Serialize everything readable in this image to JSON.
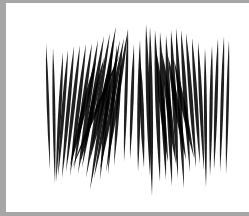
{
  "artwork": {
    "description": "abstract black needle strokes on white canvas",
    "colors": {
      "stroke": "#000000",
      "canvas": "#ffffff",
      "border": "#a6a6a6"
    },
    "strokes": [
      {
        "x1": 46,
        "y1": 43,
        "x2": 50,
        "y2": 170,
        "w": 2.6
      },
      {
        "x1": 53,
        "y1": 48,
        "x2": 55,
        "y2": 184,
        "w": 2.8
      },
      {
        "x1": 63,
        "y1": 52,
        "x2": 56,
        "y2": 182,
        "w": 3.2
      },
      {
        "x1": 68,
        "y1": 50,
        "x2": 58,
        "y2": 176,
        "w": 3.4
      },
      {
        "x1": 74,
        "y1": 46,
        "x2": 62,
        "y2": 178,
        "w": 3.6
      },
      {
        "x1": 80,
        "y1": 45,
        "x2": 66,
        "y2": 172,
        "w": 3.6
      },
      {
        "x1": 86,
        "y1": 44,
        "x2": 70,
        "y2": 176,
        "w": 3.8
      },
      {
        "x1": 92,
        "y1": 43,
        "x2": 74,
        "y2": 170,
        "w": 3.8
      },
      {
        "x1": 98,
        "y1": 40,
        "x2": 78,
        "y2": 174,
        "w": 4.0
      },
      {
        "x1": 104,
        "y1": 36,
        "x2": 82,
        "y2": 168,
        "w": 4.0
      },
      {
        "x1": 110,
        "y1": 33,
        "x2": 86,
        "y2": 178,
        "w": 4.0
      },
      {
        "x1": 116,
        "y1": 26,
        "x2": 90,
        "y2": 190,
        "w": 4.2
      },
      {
        "x1": 120,
        "y1": 40,
        "x2": 94,
        "y2": 178,
        "w": 4.0
      },
      {
        "x1": 124,
        "y1": 38,
        "x2": 100,
        "y2": 170,
        "w": 4.0
      },
      {
        "x1": 128,
        "y1": 30,
        "x2": 106,
        "y2": 172,
        "w": 3.8
      },
      {
        "x1": 113,
        "y1": 40,
        "x2": 100,
        "y2": 180,
        "w": 3.8
      },
      {
        "x1": 117,
        "y1": 45,
        "x2": 108,
        "y2": 174,
        "w": 3.6
      },
      {
        "x1": 122,
        "y1": 50,
        "x2": 114,
        "y2": 166,
        "w": 3.4
      },
      {
        "x1": 128,
        "y1": 28,
        "x2": 124,
        "y2": 162,
        "w": 3.0
      },
      {
        "x1": 134,
        "y1": 44,
        "x2": 130,
        "y2": 160,
        "w": 3.2
      },
      {
        "x1": 140,
        "y1": 40,
        "x2": 138,
        "y2": 172,
        "w": 3.4
      },
      {
        "x1": 146,
        "y1": 24,
        "x2": 150,
        "y2": 176,
        "w": 3.8
      },
      {
        "x1": 150,
        "y1": 27,
        "x2": 152,
        "y2": 196,
        "w": 4.0
      },
      {
        "x1": 155,
        "y1": 30,
        "x2": 160,
        "y2": 182,
        "w": 4.2
      },
      {
        "x1": 160,
        "y1": 32,
        "x2": 166,
        "y2": 180,
        "w": 4.4
      },
      {
        "x1": 166,
        "y1": 35,
        "x2": 172,
        "y2": 186,
        "w": 4.4
      },
      {
        "x1": 171,
        "y1": 30,
        "x2": 178,
        "y2": 178,
        "w": 4.4
      },
      {
        "x1": 176,
        "y1": 28,
        "x2": 184,
        "y2": 188,
        "w": 4.2
      },
      {
        "x1": 181,
        "y1": 30,
        "x2": 190,
        "y2": 172,
        "w": 4.0
      },
      {
        "x1": 186,
        "y1": 33,
        "x2": 196,
        "y2": 168,
        "w": 3.8
      },
      {
        "x1": 192,
        "y1": 38,
        "x2": 200,
        "y2": 164,
        "w": 3.6
      },
      {
        "x1": 198,
        "y1": 42,
        "x2": 204,
        "y2": 170,
        "w": 3.4
      },
      {
        "x1": 205,
        "y1": 48,
        "x2": 206,
        "y2": 188,
        "w": 3.0
      },
      {
        "x1": 212,
        "y1": 46,
        "x2": 210,
        "y2": 176,
        "w": 3.2
      },
      {
        "x1": 218,
        "y1": 38,
        "x2": 214,
        "y2": 170,
        "w": 3.2
      },
      {
        "x1": 224,
        "y1": 36,
        "x2": 220,
        "y2": 172,
        "w": 3.0
      },
      {
        "x1": 229,
        "y1": 40,
        "x2": 226,
        "y2": 174,
        "w": 2.6
      },
      {
        "x1": 140,
        "y1": 56,
        "x2": 144,
        "y2": 168,
        "w": 4.0
      },
      {
        "x1": 156,
        "y1": 50,
        "x2": 168,
        "y2": 162,
        "w": 5.0
      },
      {
        "x1": 162,
        "y1": 52,
        "x2": 176,
        "y2": 164,
        "w": 5.0
      },
      {
        "x1": 168,
        "y1": 56,
        "x2": 186,
        "y2": 160,
        "w": 5.0
      },
      {
        "x1": 174,
        "y1": 60,
        "x2": 194,
        "y2": 158,
        "w": 4.8
      },
      {
        "x1": 96,
        "y1": 60,
        "x2": 70,
        "y2": 166,
        "w": 4.8
      },
      {
        "x1": 104,
        "y1": 58,
        "x2": 80,
        "y2": 164,
        "w": 4.8
      },
      {
        "x1": 112,
        "y1": 56,
        "x2": 90,
        "y2": 160,
        "w": 4.6
      },
      {
        "x1": 120,
        "y1": 54,
        "x2": 72,
        "y2": 168,
        "w": 3.0
      }
    ]
  }
}
